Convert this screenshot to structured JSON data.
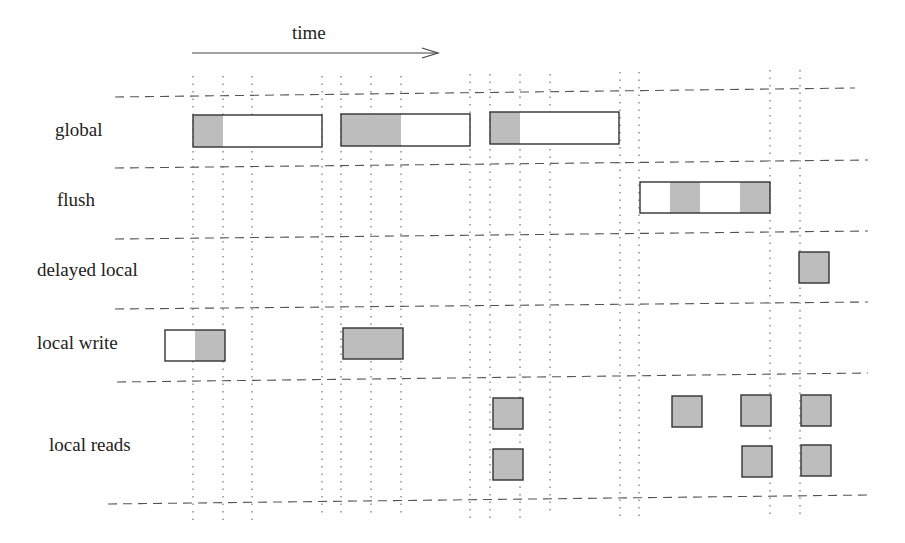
{
  "diagram": {
    "time_label": "time",
    "time_arrow": {
      "x1": 192,
      "x2": 438,
      "y": 53
    },
    "colors": {
      "fill": "#bdbdbd",
      "stroke": "#333333",
      "grid": "#555555",
      "background": "#ffffff"
    },
    "rows": [
      {
        "label": "global",
        "label_x": 55,
        "label_y": 131
      },
      {
        "label": "flush",
        "label_x": 57,
        "label_y": 201
      },
      {
        "label": "delayed local",
        "label_x": 37,
        "label_y": 271
      },
      {
        "label": "local write",
        "label_x": 37,
        "label_y": 344
      },
      {
        "label": "local reads",
        "label_x": 49,
        "label_y": 446
      }
    ],
    "h_lines": [
      {
        "x1": 115,
        "y1": 97,
        "x2": 855,
        "y2": 88
      },
      {
        "x1": 115,
        "y1": 168,
        "x2": 868,
        "y2": 160
      },
      {
        "x1": 115,
        "y1": 239,
        "x2": 868,
        "y2": 231
      },
      {
        "x1": 115,
        "y1": 309,
        "x2": 868,
        "y2": 302
      },
      {
        "x1": 117,
        "y1": 382,
        "x2": 868,
        "y2": 373
      },
      {
        "x1": 108,
        "y1": 504,
        "x2": 870,
        "y2": 495
      }
    ],
    "v_lines": [
      {
        "x": 193,
        "y1": 76,
        "y2": 520
      },
      {
        "x": 223,
        "y1": 76,
        "y2": 520
      },
      {
        "x": 252,
        "y1": 76,
        "y2": 520
      },
      {
        "x": 322,
        "y1": 76,
        "y2": 518
      },
      {
        "x": 341,
        "y1": 76,
        "y2": 518
      },
      {
        "x": 371,
        "y1": 76,
        "y2": 518
      },
      {
        "x": 401,
        "y1": 76,
        "y2": 518
      },
      {
        "x": 470,
        "y1": 74,
        "y2": 518
      },
      {
        "x": 490,
        "y1": 74,
        "y2": 518
      },
      {
        "x": 520,
        "y1": 74,
        "y2": 518
      },
      {
        "x": 550,
        "y1": 74,
        "y2": 516
      },
      {
        "x": 620,
        "y1": 72,
        "y2": 516
      },
      {
        "x": 639,
        "y1": 72,
        "y2": 516
      },
      {
        "x": 770,
        "y1": 70,
        "y2": 515
      },
      {
        "x": 800,
        "y1": 70,
        "y2": 515
      }
    ],
    "boxes": [
      {
        "row": "global",
        "x": 193,
        "y": 115,
        "w": 129,
        "h": 32,
        "shaded": [
          [
            193,
            223
          ]
        ]
      },
      {
        "row": "global",
        "x": 341,
        "y": 114,
        "w": 129,
        "h": 32,
        "shaded": [
          [
            341,
            401
          ]
        ]
      },
      {
        "row": "global",
        "x": 490,
        "y": 112,
        "w": 129,
        "h": 32,
        "shaded": [
          [
            490,
            520
          ]
        ]
      },
      {
        "row": "flush",
        "x": 640,
        "y": 182,
        "w": 130,
        "h": 31,
        "shaded": [
          [
            670,
            700
          ],
          [
            740,
            770
          ]
        ]
      },
      {
        "row": "delayed local",
        "x": 799,
        "y": 252,
        "w": 30,
        "h": 31,
        "shaded": [
          [
            799,
            829
          ]
        ]
      },
      {
        "row": "local write",
        "x": 165,
        "y": 330,
        "w": 60,
        "h": 31,
        "shaded": [
          [
            195,
            225
          ]
        ]
      },
      {
        "row": "local write",
        "x": 343,
        "y": 328,
        "w": 60,
        "h": 31,
        "shaded": [
          [
            343,
            403
          ]
        ]
      },
      {
        "row": "local reads",
        "x": 493,
        "y": 398,
        "w": 30,
        "h": 31,
        "shaded": [
          [
            493,
            523
          ]
        ]
      },
      {
        "row": "local reads",
        "x": 493,
        "y": 449,
        "w": 30,
        "h": 31,
        "shaded": [
          [
            493,
            523
          ]
        ]
      },
      {
        "row": "local reads",
        "x": 672,
        "y": 396,
        "w": 30,
        "h": 31,
        "shaded": [
          [
            672,
            702
          ]
        ]
      },
      {
        "row": "local reads",
        "x": 741,
        "y": 395,
        "w": 30,
        "h": 31,
        "shaded": [
          [
            741,
            771
          ]
        ]
      },
      {
        "row": "local reads",
        "x": 742,
        "y": 446,
        "w": 30,
        "h": 31,
        "shaded": [
          [
            742,
            772
          ]
        ]
      },
      {
        "row": "local reads",
        "x": 801,
        "y": 395,
        "w": 30,
        "h": 31,
        "shaded": [
          [
            801,
            831
          ]
        ]
      },
      {
        "row": "local reads",
        "x": 801,
        "y": 445,
        "w": 30,
        "h": 31,
        "shaded": [
          [
            801,
            831
          ]
        ]
      }
    ]
  }
}
